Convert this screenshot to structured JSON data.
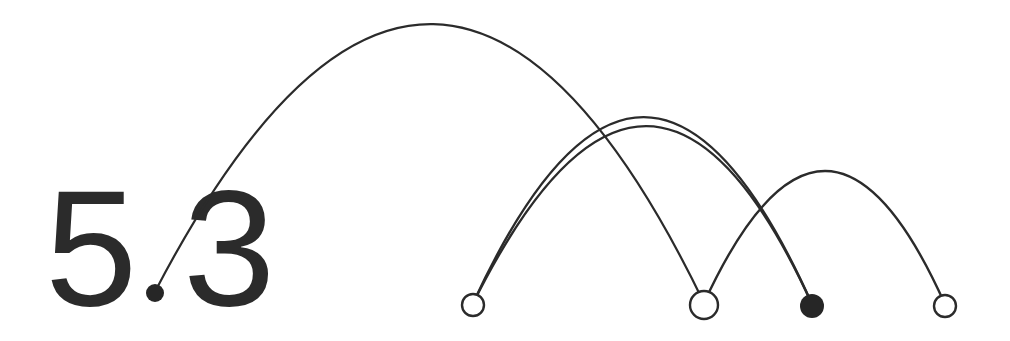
{
  "figure": {
    "label": "5.3",
    "label_digits_left": "5",
    "label_digits_right": "3",
    "label_decimal_point": ".",
    "background_color": "#ffffff",
    "ink_color": "#2b2b2b",
    "node_fill_open": "#ffffff",
    "node_fill_closed": "#262626"
  },
  "chart_data": {
    "type": "diagram",
    "diagram_kind": "arc-diagram",
    "title": "5.3",
    "xlabel": "",
    "ylabel": "",
    "grid": false,
    "legend": null,
    "baseline_y": 306,
    "xlim": [
      0,
      1010
    ],
    "ylim": [
      0,
      341
    ],
    "nodes": [
      {
        "id": "A",
        "label": "",
        "x": 155,
        "y": 293,
        "radius": 9,
        "style": "filled",
        "note": "doubles as decimal point of label 5.3"
      },
      {
        "id": "B",
        "label": "",
        "x": 473,
        "y": 305,
        "radius": 11,
        "style": "open"
      },
      {
        "id": "C",
        "label": "",
        "x": 704,
        "y": 305,
        "radius": 14,
        "style": "open"
      },
      {
        "id": "D",
        "label": "",
        "x": 812,
        "y": 306,
        "radius": 12,
        "style": "filled"
      },
      {
        "id": "E",
        "label": "",
        "x": 945,
        "y": 306,
        "radius": 11,
        "style": "open"
      }
    ],
    "arcs": [
      {
        "id": "arc-A-C",
        "from": "A",
        "to": "C",
        "apex_x": 437,
        "apex_y": 25,
        "stroke_width": 2.2
      },
      {
        "id": "arc-B-D-outer",
        "from": "B",
        "to": "D",
        "apex_x": 645,
        "apex_y": 118,
        "stroke_width": 2.4
      },
      {
        "id": "arc-B-D-inner",
        "from": "B",
        "to": "D",
        "apex_x": 650,
        "apex_y": 127,
        "stroke_width": 2.4
      },
      {
        "id": "arc-C-E",
        "from": "C",
        "to": "E",
        "apex_x": 826,
        "apex_y": 172,
        "stroke_width": 2.4
      }
    ],
    "counts": {
      "nodes": 5,
      "arcs": 4,
      "open_nodes": 3,
      "filled_nodes": 2
    }
  }
}
